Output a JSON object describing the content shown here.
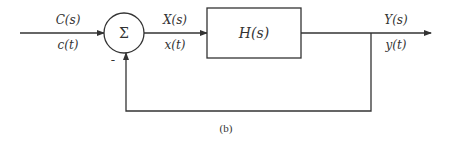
{
  "diagram": {
    "type": "feedback-control-block-diagram",
    "caption": "(b)",
    "input": {
      "laplace": "C(s)",
      "time": "c(t)"
    },
    "summer": {
      "symbol": "Σ",
      "feedback_sign": "-"
    },
    "error_signal": {
      "laplace": "X(s)",
      "time": "x(t)"
    },
    "block": {
      "label": "H(s)"
    },
    "output": {
      "laplace": "Y(s)",
      "time": "y(t)"
    }
  },
  "colors": {
    "stroke": "#333333",
    "background": "#ffffff"
  }
}
